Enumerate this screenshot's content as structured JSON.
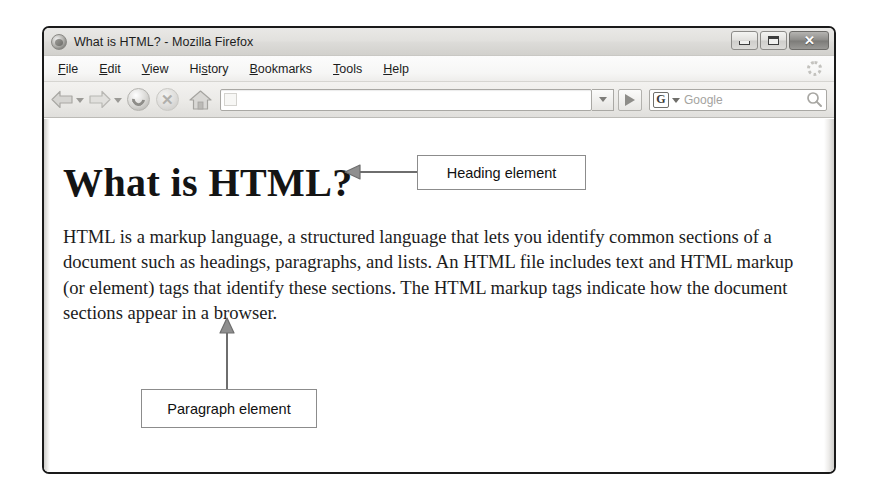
{
  "window": {
    "title": "What is HTML? - Mozilla Firefox",
    "app_icon": "firefox-globe-icon",
    "controls": {
      "minimize_label": "",
      "maximize_label": "",
      "close_label": "✕"
    }
  },
  "menu_bar": {
    "items": [
      {
        "label": "File",
        "accel": "F"
      },
      {
        "label": "Edit",
        "accel": "E"
      },
      {
        "label": "View",
        "accel": "V"
      },
      {
        "label": "History",
        "accel": "s"
      },
      {
        "label": "Bookmarks",
        "accel": "B"
      },
      {
        "label": "Tools",
        "accel": "T"
      },
      {
        "label": "Help",
        "accel": "H"
      }
    ],
    "throbber_icon": "loading-spinner-icon"
  },
  "toolbar": {
    "back_icon": "back-arrow-icon",
    "back_dropdown_icon": "chevron-down-icon",
    "forward_icon": "forward-arrow-icon",
    "forward_dropdown_icon": "chevron-down-icon",
    "reload_icon": "reload-icon",
    "stop_icon": "stop-icon",
    "home_icon": "home-icon",
    "url_value": "",
    "url_placeholder": "",
    "url_favicon": "page-favicon-icon",
    "url_dropdown_icon": "chevron-down-icon",
    "go_icon": "go-arrow-icon",
    "search_engine_letter": "G",
    "search_engine_caret_icon": "chevron-down-icon",
    "search_placeholder": "Google",
    "search_value": "",
    "search_submit_icon": "magnifier-icon"
  },
  "page": {
    "heading": "What is HTML?",
    "paragraph": "HTML is a markup language, a structured language that lets you identify common sections of a document such as headings, paragraphs, and lists. An HTML file includes text and HTML markup (or element) tags that identify these sections. The HTML markup tags indicate how the document sections appear in a browser."
  },
  "annotations": {
    "heading_callout": "Heading element",
    "paragraph_callout": "Paragraph element",
    "heading_arrow_icon": "left-arrow-annotation-icon",
    "paragraph_arrow_icon": "up-arrow-annotation-icon"
  },
  "colors": {
    "window_border": "#1a1a1a",
    "chrome_bg": "#e9e8e6",
    "page_bg": "#ffffff",
    "text": "#1c1c1c",
    "annotation_border": "#8c8c8c",
    "annotation_arrow": "#6e6e6e"
  }
}
